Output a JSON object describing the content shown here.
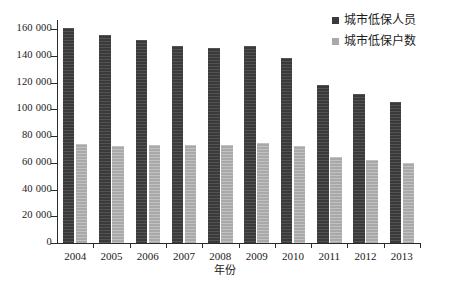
{
  "chart_data": {
    "type": "bar",
    "title": "",
    "xlabel": "年份",
    "ylabel": "",
    "categories": [
      "2004",
      "2005",
      "2006",
      "2007",
      "2008",
      "2009",
      "2010",
      "2011",
      "2012",
      "2013"
    ],
    "series": [
      {
        "name": "城市低保人员",
        "color": "#3a3a3a",
        "values": [
          161000,
          155500,
          151500,
          147500,
          145500,
          147500,
          138000,
          118500,
          111500,
          105500
        ]
      },
      {
        "name": "城市低保户数",
        "color": "#a9a9a9",
        "values": [
          74000,
          72800,
          73200,
          73300,
          73300,
          75000,
          72500,
          64500,
          62000,
          59500
        ]
      }
    ],
    "ylim": [
      0,
      160000
    ],
    "ytick_values": [
      0,
      20000,
      40000,
      60000,
      80000,
      100000,
      120000,
      140000,
      160000
    ],
    "ytick_labels": [
      "0",
      "20 000",
      "40 000",
      "60 000",
      "80 000",
      "100 000",
      "120 000",
      "140 000",
      "160 000"
    ],
    "grid": false,
    "legend_position": "top-right"
  },
  "legend": {
    "items": [
      {
        "label": "城市低保人员"
      },
      {
        "label": "城市低保户数"
      }
    ]
  },
  "axes": {
    "x_title": "年份"
  }
}
